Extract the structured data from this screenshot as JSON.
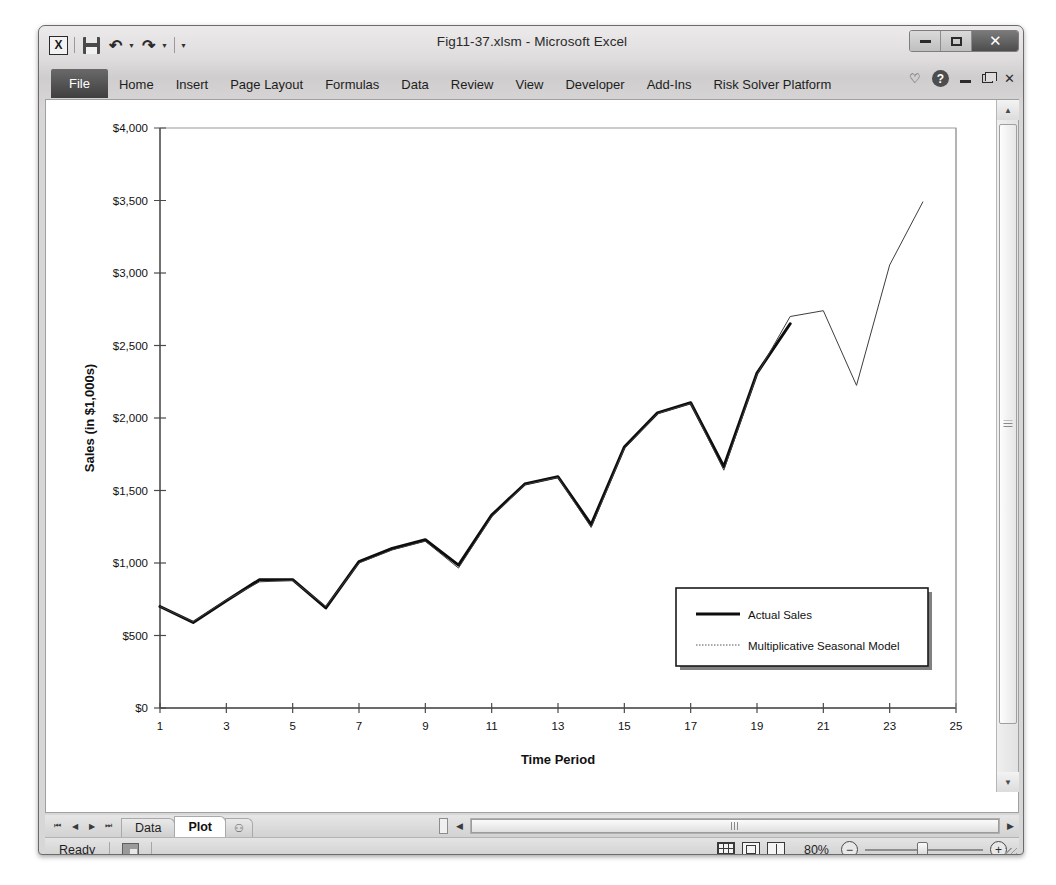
{
  "window": {
    "title": "Fig11-37.xlsm  -  Microsoft Excel",
    "quick_access": [
      {
        "name": "excel-logo",
        "label": "X"
      },
      {
        "name": "save",
        "label": "Save"
      },
      {
        "name": "undo",
        "label": "Undo"
      },
      {
        "name": "redo",
        "label": "Redo"
      },
      {
        "name": "customize",
        "label": "Customize Quick Access Toolbar"
      }
    ],
    "controls": {
      "minimize": "–",
      "maximize": "□",
      "close": "✕"
    }
  },
  "ribbon": {
    "tabs": [
      {
        "label": "File",
        "active": true
      },
      {
        "label": "Home",
        "active": false
      },
      {
        "label": "Insert",
        "active": false
      },
      {
        "label": "Page Layout",
        "active": false
      },
      {
        "label": "Formulas",
        "active": false
      },
      {
        "label": "Data",
        "active": false
      },
      {
        "label": "Review",
        "active": false
      },
      {
        "label": "View",
        "active": false
      },
      {
        "label": "Developer",
        "active": false
      },
      {
        "label": "Add-Ins",
        "active": false
      },
      {
        "label": "Risk Solver Platform",
        "active": false
      }
    ],
    "right_icons": [
      {
        "name": "collapse-ribbon-icon",
        "glyph": "♡"
      },
      {
        "name": "help-icon",
        "glyph": "?"
      },
      {
        "name": "document-minimize-icon",
        "glyph": "–"
      },
      {
        "name": "document-restore-icon",
        "glyph": "❐"
      },
      {
        "name": "document-close-icon",
        "glyph": "✕"
      }
    ]
  },
  "sheet_tabs": {
    "nav": [
      "⏮",
      "◀",
      "▶",
      "⏭"
    ],
    "tabs": [
      {
        "label": "Data",
        "active": false
      },
      {
        "label": "Plot",
        "active": true
      }
    ],
    "new_sheet_label": "⚇"
  },
  "status": {
    "ready": "Ready",
    "zoom": "80%",
    "views": [
      "normal-view",
      "page-layout-view",
      "page-break-view"
    ],
    "zoom_out": "−",
    "zoom_in": "+"
  },
  "chart_data": {
    "type": "line",
    "title": "",
    "xlabel": "Time Period",
    "ylabel": "Sales (in $1,000s)",
    "xlim": [
      1,
      25
    ],
    "ylim": [
      0,
      4000
    ],
    "ytick_step": 500,
    "xtick_step": 2,
    "ytick_labels": [
      "$0",
      "$500",
      "$1,000",
      "$1,500",
      "$2,000",
      "$2,500",
      "$3,000",
      "$3,500",
      "$4,000"
    ],
    "xtick_labels": [
      "1",
      "3",
      "5",
      "7",
      "9",
      "11",
      "13",
      "15",
      "17",
      "19",
      "21",
      "23",
      "25"
    ],
    "grid": false,
    "legend": {
      "position": "inside-bottom-right",
      "entries": [
        {
          "name": "Actual Sales",
          "style": "thick-solid"
        },
        {
          "name": "Multiplicative Seasonal Model",
          "style": "thin-dotted"
        }
      ]
    },
    "x": [
      1,
      2,
      3,
      4,
      5,
      6,
      7,
      8,
      9,
      10,
      11,
      12,
      13,
      14,
      15,
      16,
      17,
      18,
      19,
      20,
      21,
      22,
      23,
      24
    ],
    "series": [
      {
        "name": "Actual Sales",
        "values": [
          700,
          590,
          740,
          885,
          885,
          690,
          1010,
          1100,
          1160,
          985,
          1330,
          1545,
          1595,
          1265,
          1800,
          2035,
          2105,
          1665,
          2310,
          2650,
          null,
          null,
          null,
          null
        ]
      },
      {
        "name": "Multiplicative Seasonal Model",
        "values": [
          700,
          595,
          745,
          870,
          880,
          700,
          1000,
          1090,
          1150,
          965,
          1320,
          1540,
          1590,
          1245,
          1790,
          2030,
          2100,
          1640,
          2300,
          2700,
          2740,
          2225,
          3055,
          3490
        ]
      }
    ]
  }
}
